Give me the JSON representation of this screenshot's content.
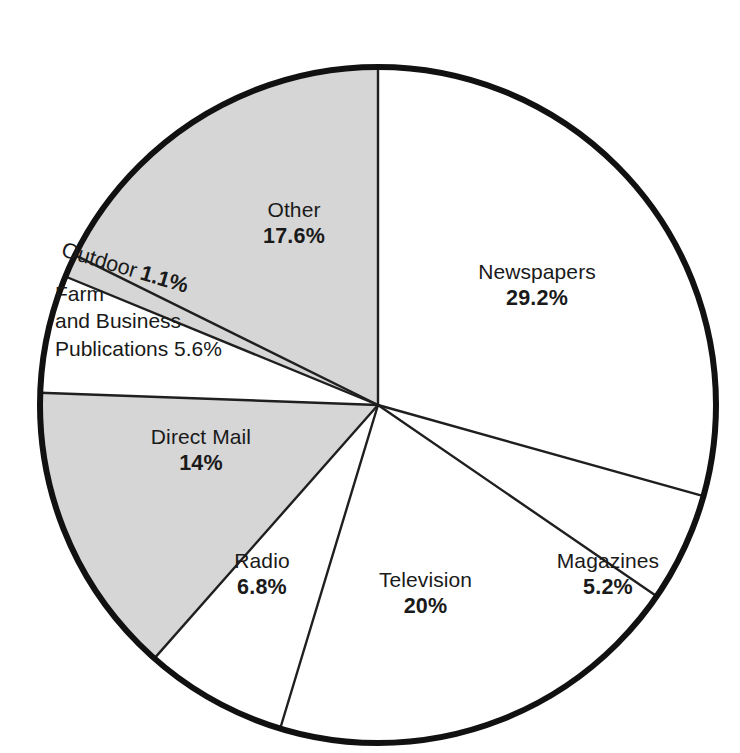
{
  "chart_data": {
    "type": "pie",
    "title": "",
    "subtitle": "",
    "xlabel": "",
    "ylabel": "",
    "legend_position": "none",
    "grid": false,
    "units": "percent",
    "start_angle_deg": 0,
    "direction": "clockwise",
    "categories": [
      "Newspapers",
      "Magazines",
      "Television",
      "Radio",
      "Direct Mail",
      "Farm and Business Publications",
      "Outdoor",
      "Other"
    ],
    "values": [
      29.2,
      5.2,
      20,
      6.8,
      14,
      5.6,
      1.1,
      17.6
    ],
    "slices": [
      {
        "id": "newspapers",
        "name": "Newspapers",
        "value": 29.2,
        "value_label": "29.2%",
        "fill": "white",
        "fill_color": "#ffffff"
      },
      {
        "id": "magazines",
        "name": "Magazines",
        "value": 5.2,
        "value_label": "5.2%",
        "fill": "white",
        "fill_color": "#ffffff"
      },
      {
        "id": "television",
        "name": "Television",
        "value": 20,
        "value_label": "20%",
        "fill": "white",
        "fill_color": "#ffffff"
      },
      {
        "id": "radio",
        "name": "Radio",
        "value": 6.8,
        "value_label": "6.8%",
        "fill": "white",
        "fill_color": "#ffffff"
      },
      {
        "id": "direct-mail",
        "name": "Direct Mail",
        "value": 14,
        "value_label": "14%",
        "fill": "shaded",
        "fill_color": "#d6d6d6"
      },
      {
        "id": "farm-and-business-publications",
        "name": "Farm and Business Publications",
        "name_line_1": "Farm",
        "name_line_2": "and Business",
        "name_line_3": "Publications 5.6%",
        "value": 5.6,
        "value_label": "5.6%",
        "fill": "white",
        "fill_color": "#ffffff"
      },
      {
        "id": "outdoor",
        "name": "Outdoor",
        "value": 1.1,
        "value_label": "1.1%",
        "fill": "shaded",
        "fill_color": "#d6d6d6"
      },
      {
        "id": "other",
        "name": "Other",
        "value": 17.6,
        "value_label": "17.6%",
        "fill": "shaded",
        "fill_color": "#d6d6d6"
      }
    ],
    "total": 100.5
  },
  "style": {
    "outline_color": "#111111",
    "divider_color": "#222222",
    "shaded_color": "#d6d6d6",
    "background": "#ffffff",
    "text_color": "#1a1a1a"
  }
}
